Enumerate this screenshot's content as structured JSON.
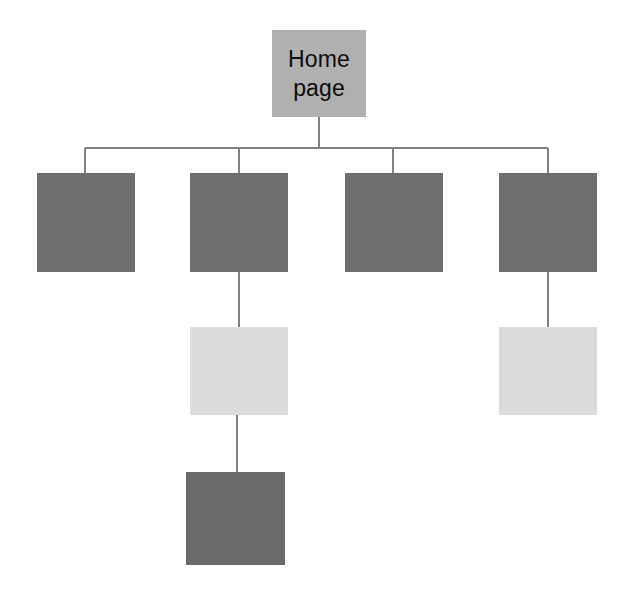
{
  "diagram": {
    "type": "site-map-tree",
    "title": "",
    "canvas": {
      "width": 618,
      "height": 592,
      "background": "#ffffff"
    },
    "connector": {
      "color": "#808080",
      "width": 2
    },
    "palette": {
      "root_fill": "#b0b0b0",
      "level2_fill": "#6e6e6e",
      "level3_fill": "#dcdcdc",
      "level4_fill": "#6a6a6a",
      "text": "#0d0d0d",
      "line": "#808080"
    },
    "nodes": [
      {
        "id": "home-page",
        "label": "Home\npage",
        "level": 1,
        "fill": "#b0b0b0",
        "x": 272,
        "y": 30,
        "w": 94,
        "h": 87
      },
      {
        "id": "section-1",
        "label": "",
        "level": 2,
        "fill": "#6e6e6e",
        "x": 37,
        "y": 173,
        "w": 98,
        "h": 99
      },
      {
        "id": "section-2",
        "label": "",
        "level": 2,
        "fill": "#6e6e6e",
        "x": 190,
        "y": 173,
        "w": 98,
        "h": 99
      },
      {
        "id": "section-3",
        "label": "",
        "level": 2,
        "fill": "#6e6e6e",
        "x": 345,
        "y": 173,
        "w": 98,
        "h": 99
      },
      {
        "id": "section-4",
        "label": "",
        "level": 2,
        "fill": "#6e6e6e",
        "x": 499,
        "y": 173,
        "w": 98,
        "h": 99
      },
      {
        "id": "subsection-2-1",
        "label": "",
        "level": 3,
        "fill": "#dcdcdc",
        "x": 190,
        "y": 327,
        "w": 98,
        "h": 88
      },
      {
        "id": "subsection-4-1",
        "label": "",
        "level": 3,
        "fill": "#dcdcdc",
        "x": 499,
        "y": 327,
        "w": 98,
        "h": 88
      },
      {
        "id": "subsection-2-1-1",
        "label": "",
        "level": 4,
        "fill": "#6a6a6a",
        "x": 186,
        "y": 472,
        "w": 99,
        "h": 93
      }
    ],
    "edges": [
      {
        "id": "edge-root-trunk",
        "from": "home-page",
        "to": "bus",
        "kind": "vertical"
      },
      {
        "id": "edge-bus",
        "from": "bus-left",
        "to": "bus-right",
        "kind": "horizontal"
      },
      {
        "id": "edge-bus-section-1",
        "from": "bus",
        "to": "section-1",
        "kind": "vertical"
      },
      {
        "id": "edge-bus-section-2",
        "from": "bus",
        "to": "section-2",
        "kind": "vertical"
      },
      {
        "id": "edge-bus-section-3",
        "from": "bus",
        "to": "section-3",
        "kind": "vertical"
      },
      {
        "id": "edge-bus-section-4",
        "from": "bus",
        "to": "section-4",
        "kind": "vertical"
      },
      {
        "id": "edge-section-2-sub",
        "from": "section-2",
        "to": "subsection-2-1",
        "kind": "vertical"
      },
      {
        "id": "edge-section-4-sub",
        "from": "section-4",
        "to": "subsection-4-1",
        "kind": "vertical"
      },
      {
        "id": "edge-sub-to-leaf",
        "from": "subsection-2-1",
        "to": "subsection-2-1-1",
        "kind": "vertical"
      }
    ]
  }
}
